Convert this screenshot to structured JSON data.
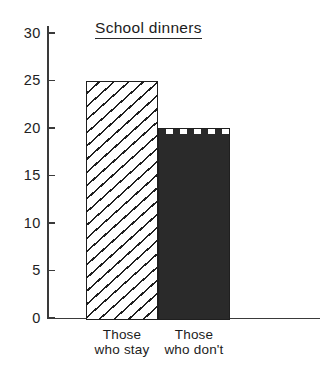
{
  "chart_data": {
    "type": "bar",
    "title": "School dinners",
    "title_underlined": true,
    "xlabel": "",
    "ylabel": "",
    "categories": [
      "Those who stay",
      "Those who don't"
    ],
    "category_lines": [
      [
        "Those",
        "who stay"
      ],
      [
        "Those",
        "who don't"
      ]
    ],
    "values": [
      25,
      20
    ],
    "ylim": [
      0,
      30
    ],
    "yticks": [
      0,
      5,
      10,
      15,
      20,
      25,
      30
    ],
    "ytick_labels": [
      "0",
      "5",
      "10",
      "15",
      "20",
      "25",
      "30"
    ],
    "grid": false,
    "legend": false,
    "bar_styles": [
      "diagonal-hatch",
      "horizontal-dashes"
    ],
    "bars_adjacent": true,
    "style": "hand-drawn line art, black on white"
  },
  "colors": {
    "ink": "#1f1f1f",
    "axis": "#3a3a3a",
    "background": "#ffffff"
  }
}
